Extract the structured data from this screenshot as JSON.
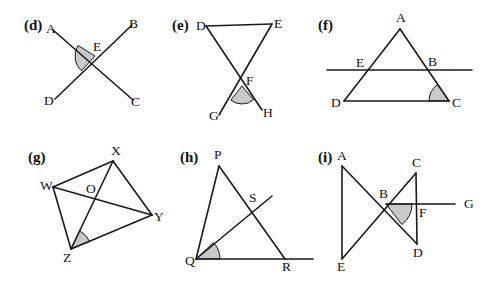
{
  "figure": {
    "background_color": "#ffffff",
    "line_color": "#1a1a1a",
    "shade_color": "#c9c9c9",
    "panels": [
      {
        "id": "d",
        "label": "(d)",
        "label_pos": {
          "x": 24,
          "y": 30
        },
        "description": "Two straight lines AC and DB crossing at E with angle AED shaded",
        "points": [
          {
            "name": "A",
            "x": 53,
            "y": 30,
            "label_x": 46,
            "label_y": 33
          },
          {
            "name": "B",
            "x": 132,
            "y": 25,
            "label_x": 129,
            "label_y": 28
          },
          {
            "name": "C",
            "x": 133,
            "y": 100,
            "label_x": 131,
            "label_y": 106
          },
          {
            "name": "D",
            "x": 55,
            "y": 99,
            "label_x": 44,
            "label_y": 105
          },
          {
            "name": "E",
            "x": 95,
            "y": 56,
            "label_x": 93,
            "label_y": 51
          }
        ],
        "segments": [
          {
            "from": "A",
            "to": "C"
          },
          {
            "from": "D",
            "to": "B"
          }
        ],
        "shaded_angle": {
          "vertex": "E",
          "from": "A",
          "to": "D",
          "radius": 20
        }
      },
      {
        "id": "e",
        "label": "(e)",
        "label_pos": {
          "x": 172,
          "y": 30
        },
        "description": "Triangle DEF with sides extended through F to G and H; angle GFH shaded",
        "points": [
          {
            "name": "D",
            "x": 206,
            "y": 26,
            "label_x": 196,
            "label_y": 30
          },
          {
            "name": "E",
            "x": 272,
            "y": 24,
            "label_x": 274,
            "label_y": 28
          },
          {
            "name": "F",
            "x": 242,
            "y": 86,
            "label_x": 246,
            "label_y": 85
          },
          {
            "name": "G",
            "x": 219,
            "y": 115,
            "label_x": 209,
            "label_y": 120
          },
          {
            "name": "H",
            "x": 262,
            "y": 110,
            "label_x": 263,
            "label_y": 117
          }
        ],
        "segments": [
          {
            "from": "D",
            "to": "E"
          },
          {
            "from": "D",
            "to": "H"
          },
          {
            "from": "E",
            "to": "G"
          }
        ],
        "shaded_angle": {
          "vertex": "F",
          "from": "G",
          "to": "H",
          "radius": 18
        }
      },
      {
        "id": "f",
        "label": "(f)",
        "label_pos": {
          "x": 318,
          "y": 30
        },
        "description": "Triangle ADC cut by a horizontal transversal through E and B; angle ACD shaded",
        "points": [
          {
            "name": "A",
            "x": 400,
            "y": 29,
            "label_x": 396,
            "label_y": 22
          },
          {
            "name": "E",
            "x": 367,
            "y": 70,
            "label_x": 356,
            "label_y": 67
          },
          {
            "name": "B",
            "x": 429,
            "y": 70,
            "label_x": 428,
            "label_y": 66
          },
          {
            "name": "D",
            "x": 344,
            "y": 101,
            "label_x": 331,
            "label_y": 107
          },
          {
            "name": "C",
            "x": 449,
            "y": 101,
            "label_x": 452,
            "label_y": 107
          }
        ],
        "segments": [
          {
            "from": "A",
            "to": "D"
          },
          {
            "from": "A",
            "to": "C"
          },
          {
            "from": "D",
            "to": "C"
          }
        ],
        "transversal": {
          "x1": 327,
          "y1": 70,
          "x2": 472,
          "y2": 70
        },
        "shaded_angle": {
          "vertex": "C",
          "from": "D",
          "to": "A",
          "radius": 20
        }
      },
      {
        "id": "g",
        "label": "(g)",
        "label_pos": {
          "x": 28,
          "y": 162
        },
        "description": "Quadrilateral WXYZ with diagonals WY and XZ meeting at O; angle XZY shaded",
        "points": [
          {
            "name": "W",
            "x": 53,
            "y": 187,
            "label_x": 40,
            "label_y": 190
          },
          {
            "name": "X",
            "x": 113,
            "y": 161,
            "label_x": 111,
            "label_y": 155
          },
          {
            "name": "Y",
            "x": 152,
            "y": 215,
            "label_x": 154,
            "label_y": 221
          },
          {
            "name": "Z",
            "x": 71,
            "y": 249,
            "label_x": 63,
            "label_y": 262
          },
          {
            "name": "O",
            "x": 90,
            "y": 197,
            "label_x": 86,
            "label_y": 193
          }
        ],
        "segments": [
          {
            "from": "W",
            "to": "X"
          },
          {
            "from": "X",
            "to": "Y"
          },
          {
            "from": "Y",
            "to": "Z"
          },
          {
            "from": "Z",
            "to": "W"
          },
          {
            "from": "W",
            "to": "Y"
          },
          {
            "from": "X",
            "to": "Z"
          }
        ],
        "shaded_angle": {
          "vertex": "Z",
          "from": "X",
          "to": "Y",
          "radius": 20
        }
      },
      {
        "id": "h",
        "label": "(h)",
        "label_pos": {
          "x": 180,
          "y": 162
        },
        "description": "Triangle PQR with ray from Q through S on PR; QR extended beyond R; angle SQR shaded",
        "points": [
          {
            "name": "P",
            "x": 219,
            "y": 166,
            "label_x": 214,
            "label_y": 159
          },
          {
            "name": "Q",
            "x": 196,
            "y": 259,
            "label_x": 185,
            "label_y": 265
          },
          {
            "name": "R",
            "x": 285,
            "y": 259,
            "label_x": 282,
            "label_y": 271
          },
          {
            "name": "S",
            "x": 252,
            "y": 206,
            "label_x": 249,
            "label_y": 202
          }
        ],
        "segments": [
          {
            "from": "P",
            "to": "Q"
          },
          {
            "from": "P",
            "to": "R"
          }
        ],
        "rays": [
          {
            "name": "QS-ray",
            "x1": 196,
            "y1": 259,
            "x2": 272,
            "y2": 196
          },
          {
            "name": "QR-ray",
            "x1": 196,
            "y1": 259,
            "x2": 313,
            "y2": 259
          }
        ],
        "shaded_angle": {
          "vertex": "Q",
          "from": "R",
          "to": "S",
          "radius": 24
        }
      },
      {
        "id": "i",
        "label": "(i)",
        "label_pos": {
          "x": 318,
          "y": 162
        },
        "description": "Segments AD and CE crossing at B with vertical sides AE and CD; horizontal ray from B through F to G; angle FBD shaded",
        "points": [
          {
            "name": "A",
            "x": 342,
            "y": 166,
            "label_x": 337,
            "label_y": 160
          },
          {
            "name": "C",
            "x": 416,
            "y": 173,
            "label_x": 412,
            "label_y": 167
          },
          {
            "name": "B",
            "x": 386,
            "y": 204,
            "label_x": 379,
            "label_y": 198
          },
          {
            "name": "F",
            "x": 417,
            "y": 204,
            "label_x": 419,
            "label_y": 217
          },
          {
            "name": "G",
            "x": 462,
            "y": 204,
            "label_x": 464,
            "label_y": 208
          },
          {
            "name": "D",
            "x": 417,
            "y": 244,
            "label_x": 413,
            "label_y": 257
          },
          {
            "name": "E",
            "x": 342,
            "y": 259,
            "label_x": 337,
            "label_y": 271
          }
        ],
        "segments": [
          {
            "from": "A",
            "to": "E"
          },
          {
            "from": "A",
            "to": "D"
          },
          {
            "from": "C",
            "to": "E"
          },
          {
            "from": "C",
            "to": "D"
          }
        ],
        "rays": [
          {
            "name": "BG-ray",
            "x1": 386,
            "y1": 204,
            "x2": 455,
            "y2": 204
          }
        ],
        "shaded_angle": {
          "vertex": "B",
          "from": "D",
          "to": "F",
          "radius": 26
        }
      }
    ]
  }
}
